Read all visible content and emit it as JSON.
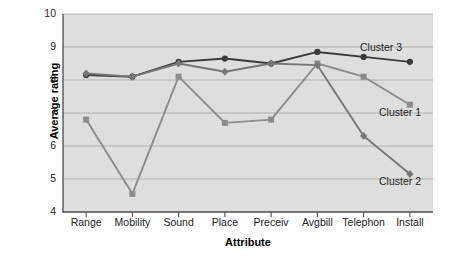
{
  "chart_data": {
    "type": "line",
    "title": "",
    "xlabel": "Attribute",
    "ylabel": "Average rating",
    "categories": [
      "Range",
      "Mobility",
      "Sound",
      "Place",
      "Preceiv",
      "Avgbill",
      "Telephon",
      "Install"
    ],
    "ylim": [
      4,
      10
    ],
    "yticks": [
      4,
      5,
      6,
      7,
      8,
      9,
      10
    ],
    "grid": true,
    "legend_position": "inline-right",
    "plot_background": "#dededd",
    "series": [
      {
        "name": "Cluster 3",
        "color": "#3a3a3a",
        "marker": "circle",
        "values": [
          8.15,
          8.1,
          8.55,
          8.65,
          8.5,
          8.85,
          8.7,
          8.55
        ],
        "label_x": 360,
        "label_y": 41
      },
      {
        "name": "Cluster 1",
        "color": "#8c8c8c",
        "marker": "square",
        "values": [
          6.8,
          4.55,
          8.1,
          6.7,
          6.8,
          8.5,
          8.1,
          7.25
        ],
        "label_x": 379,
        "label_y": 106
      },
      {
        "name": "Cluster 2",
        "color": "#777777",
        "marker": "diamond",
        "values": [
          8.2,
          8.1,
          8.5,
          8.25,
          8.5,
          8.45,
          6.3,
          5.15
        ],
        "label_x": 379,
        "label_y": 175
      }
    ]
  },
  "axes": {
    "ylabel_text": "Average rating",
    "xlabel_text": "Attribute",
    "ytick_labels": [
      "10",
      "9",
      "8",
      "7",
      "6",
      "5",
      "4"
    ],
    "xtick_labels": [
      "Range",
      "Mobility",
      "Sound",
      "Place",
      "Preceiv",
      "Avgbill",
      "Telephon",
      "Install"
    ]
  },
  "legend": {
    "items": [
      {
        "label": "Cluster 3"
      },
      {
        "label": "Cluster 1"
      },
      {
        "label": "Cluster 2"
      }
    ]
  }
}
